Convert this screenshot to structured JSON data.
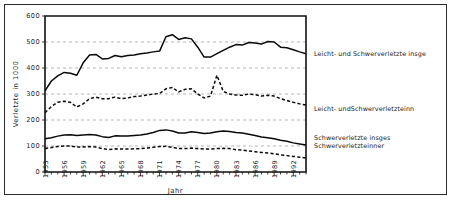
{
  "chart_data": {
    "type": "line",
    "title": "",
    "xlabel": "Jahr",
    "ylabel": "Verletzte in 1000",
    "xlim": [
      1953,
      1994
    ],
    "ylim": [
      0,
      600
    ],
    "yticks": [
      0,
      100,
      200,
      300,
      400,
      500,
      600
    ],
    "xticks": [
      1953,
      1956,
      1959,
      1962,
      1965,
      1968,
      1971,
      1974,
      1977,
      1980,
      1983,
      1986,
      1989,
      1992
    ],
    "x": [
      1953,
      1954,
      1955,
      1956,
      1957,
      1958,
      1959,
      1960,
      1961,
      1962,
      1963,
      1964,
      1965,
      1966,
      1967,
      1968,
      1969,
      1970,
      1971,
      1972,
      1973,
      1974,
      1975,
      1976,
      1977,
      1978,
      1979,
      1980,
      1981,
      1982,
      1983,
      1984,
      1985,
      1986,
      1987,
      1988,
      1989,
      1990,
      1991,
      1992,
      1993,
      1994
    ],
    "grid": true,
    "legend_position": "right",
    "series": [
      {
        "name": "Leicht- und Schwerverletzte insgesamt",
        "style": "solid",
        "label_y": 454,
        "values": [
          312,
          350,
          370,
          383,
          380,
          372,
          420,
          450,
          452,
          435,
          437,
          448,
          443,
          448,
          450,
          455,
          458,
          462,
          465,
          520,
          528,
          510,
          516,
          512,
          480,
          442,
          442,
          455,
          468,
          480,
          490,
          488,
          498,
          496,
          492,
          502,
          500,
          480,
          478,
          470,
          462,
          455
        ]
      },
      {
        "name": "Leicht- und Schwerverletzte innerorts",
        "style": "dashed",
        "label_y": 242,
        "values": [
          228,
          252,
          268,
          272,
          268,
          250,
          262,
          282,
          288,
          282,
          282,
          288,
          282,
          285,
          290,
          292,
          296,
          300,
          302,
          320,
          325,
          308,
          318,
          320,
          300,
          285,
          292,
          372,
          310,
          300,
          296,
          295,
          300,
          298,
          292,
          295,
          292,
          282,
          275,
          268,
          262,
          258
        ]
      },
      {
        "name": "Schwerverletzte insgesamt",
        "style": "solid",
        "label_y": 132,
        "values": [
          128,
          132,
          138,
          142,
          143,
          140,
          142,
          144,
          142,
          136,
          133,
          139,
          138,
          138,
          140,
          142,
          146,
          152,
          160,
          162,
          158,
          150,
          150,
          155,
          152,
          148,
          150,
          155,
          158,
          156,
          152,
          150,
          145,
          140,
          135,
          132,
          128,
          122,
          118,
          112,
          108,
          104
        ]
      },
      {
        "name": "Schwerverletzte innerorts",
        "style": "dashed",
        "label_y": 100,
        "values": [
          90,
          94,
          98,
          100,
          100,
          96,
          96,
          98,
          96,
          90,
          86,
          89,
          88,
          88,
          89,
          90,
          92,
          95,
          98,
          99,
          95,
          90,
          90,
          92,
          90,
          88,
          88,
          90,
          91,
          90,
          86,
          84,
          81,
          78,
          75,
          73,
          70,
          66,
          63,
          60,
          57,
          54
        ]
      }
    ],
    "legend_entries": [
      "Leicht- und Schwerverletzte insge",
      "Leicht- undSchwerverletzteinn",
      "Schwerverletzte insges",
      "Schwerverletzteinner"
    ]
  },
  "colors": {
    "ink": "#0a0a0a",
    "grid": "#9a9a9a",
    "border": "#2b2b2b",
    "background": "#ffffff"
  }
}
